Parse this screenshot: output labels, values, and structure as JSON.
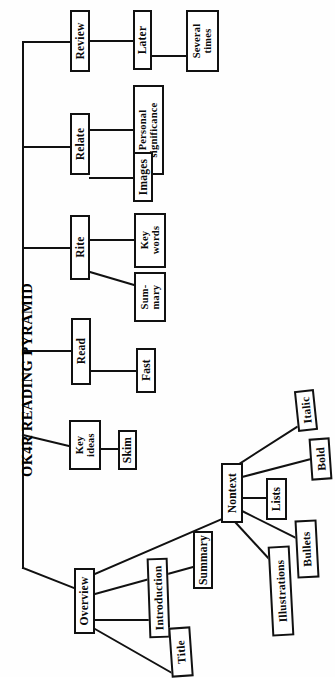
{
  "diagram": {
    "title": "OK4R READING PYRAMID",
    "type": "tree-hierarchy",
    "orientation": "rotated-90-counterclockwise",
    "root_label": "OK4R READING PYRAMID",
    "colors": {
      "background": "#ffffff",
      "line": "#111111",
      "text": "#0a0a0a",
      "box_fill": "#ffffff"
    },
    "nodes": {
      "review": "Review",
      "later": "Later",
      "several_times": "Several\ntimes",
      "relate": "Relate",
      "personal_significance": "Personal\nsignificance",
      "images": "Images",
      "rite": "Rite",
      "key_words": "Key\nwords",
      "summary_short": "Sum-\nmary",
      "read": "Read",
      "fast": "Fast",
      "key_ideas": "Key\nideas",
      "skim": "Skim",
      "overview": "Overview",
      "nontext": "Nontext",
      "italic": "Italic",
      "bold": "Bold",
      "lists": "Lists",
      "bullets": "Bullets",
      "illustrations": "Illustrations",
      "summary": "Summary",
      "introduction": "Introduction",
      "title_node": "Title"
    },
    "branches": [
      {
        "parent": "OK4R READING PYRAMID",
        "children": [
          "Review",
          "Relate",
          "Rite",
          "Read",
          "Key ideas",
          "Overview"
        ]
      },
      {
        "parent": "Review",
        "children": [
          "Later"
        ]
      },
      {
        "parent": "Later",
        "children": [
          "Several times"
        ]
      },
      {
        "parent": "Relate",
        "children": [
          "Personal significance",
          "Images"
        ]
      },
      {
        "parent": "Rite",
        "children": [
          "Key words",
          "Sum-mary"
        ]
      },
      {
        "parent": "Read",
        "children": [
          "Fast"
        ]
      },
      {
        "parent": "Key ideas",
        "children": [
          "Skim"
        ]
      },
      {
        "parent": "Overview",
        "children": [
          "Nontext",
          "Summary",
          "Introduction",
          "Title"
        ]
      },
      {
        "parent": "Nontext",
        "children": [
          "Italic",
          "Bold",
          "Lists",
          "Bullets",
          "Illustrations"
        ]
      }
    ]
  }
}
